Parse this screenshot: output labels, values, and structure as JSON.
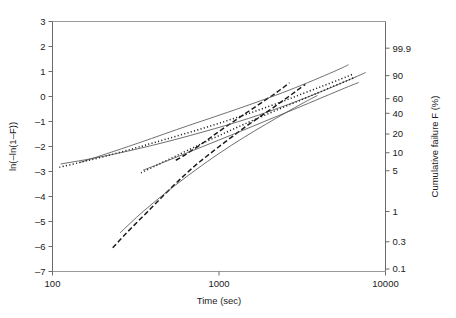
{
  "chart_data": {
    "type": "line",
    "title": "",
    "subtitle": "",
    "xlabel": "Time (sec)",
    "ylabel": "ln(–ln(1–F))",
    "y2label": "Cumulative failure F (%)",
    "xscale": "log",
    "xlim": [
      100,
      10000
    ],
    "ylim": [
      -7,
      3
    ],
    "grid": false,
    "legend": "none",
    "xticks": [
      "100",
      "1000",
      "10000"
    ],
    "xtick_values": [
      100,
      1000,
      10000
    ],
    "yticks": [
      "3",
      "2",
      "1",
      "0",
      "-1",
      "-2",
      "-3",
      "-4",
      "-5",
      "-6",
      "-7"
    ],
    "ytick_values": [
      3,
      2,
      1,
      0,
      -1,
      -2,
      -3,
      -4,
      -5,
      -6,
      -7
    ],
    "y2ticks": [
      "99.9",
      "90",
      "60",
      "40",
      "20",
      "10",
      "5",
      "1",
      "0.3",
      "0.1"
    ],
    "y2tick_values": [
      99.9,
      90,
      60,
      40,
      20,
      10,
      5,
      1,
      0.3,
      0.1
    ],
    "y2tick_positions": [
      1.933,
      0.834,
      -0.087,
      -0.672,
      -1.5,
      -2.25,
      -2.97,
      -4.6,
      -5.81,
      -6.9
    ],
    "series": [
      {
        "name": "dataset-1-data",
        "style": "dashed-thick",
        "color": "#1a1a1a",
        "points": [
          [
            550,
            -2.55
          ],
          [
            620,
            -2.35
          ],
          [
            700,
            -2.12
          ],
          [
            800,
            -1.86
          ],
          [
            900,
            -1.62
          ],
          [
            1000,
            -1.4
          ],
          [
            1150,
            -1.12
          ],
          [
            1300,
            -0.88
          ],
          [
            1500,
            -0.6
          ],
          [
            1700,
            -0.36
          ],
          [
            1900,
            -0.14
          ],
          [
            2100,
            0.05
          ],
          [
            2300,
            0.24
          ],
          [
            2500,
            0.42
          ],
          [
            2650,
            0.55
          ]
        ]
      },
      {
        "name": "dataset-1-fit",
        "style": "solid-thin",
        "color": "#4a4a4a",
        "points": [
          [
            145,
            -2.65
          ],
          [
            300,
            -1.95
          ],
          [
            600,
            -1.25
          ],
          [
            1000,
            -0.75
          ],
          [
            1600,
            -0.28
          ],
          [
            2400,
            0.15
          ],
          [
            3400,
            0.55
          ],
          [
            4600,
            0.92
          ],
          [
            5500,
            1.15
          ],
          [
            6000,
            1.27
          ]
        ]
      },
      {
        "name": "dataset-2-data",
        "style": "dotted",
        "color": "#1a1a1a",
        "points": [
          [
            110,
            -2.83
          ],
          [
            150,
            -2.62
          ],
          [
            210,
            -2.38
          ],
          [
            300,
            -2.1
          ],
          [
            420,
            -1.82
          ],
          [
            600,
            -1.52
          ],
          [
            850,
            -1.22
          ],
          [
            1200,
            -0.9
          ],
          [
            1700,
            -0.56
          ],
          [
            2400,
            -0.2
          ],
          [
            3200,
            0.12
          ],
          [
            4200,
            0.42
          ],
          [
            5400,
            0.7
          ],
          [
            6400,
            0.9
          ]
        ]
      },
      {
        "name": "dataset-2-fit",
        "style": "solid-thin",
        "color": "#4a4a4a",
        "points": [
          [
            112,
            -2.7
          ],
          [
            200,
            -2.4
          ],
          [
            400,
            -1.95
          ],
          [
            800,
            -1.42
          ],
          [
            1500,
            -0.88
          ],
          [
            2600,
            -0.32
          ],
          [
            4200,
            0.22
          ],
          [
            6200,
            0.7
          ],
          [
            7600,
            0.96
          ]
        ]
      },
      {
        "name": "dataset-3-data",
        "style": "dashed-thick",
        "color": "#1a1a1a",
        "points": [
          [
            230,
            -6.05
          ],
          [
            270,
            -5.55
          ],
          [
            320,
            -5.05
          ],
          [
            380,
            -4.55
          ],
          [
            450,
            -4.05
          ],
          [
            530,
            -3.58
          ],
          [
            620,
            -3.15
          ],
          [
            720,
            -2.76
          ],
          [
            840,
            -2.4
          ],
          [
            980,
            -2.05
          ],
          [
            1150,
            -1.7
          ],
          [
            1350,
            -1.35
          ],
          [
            1600,
            -1.0
          ],
          [
            1900,
            -0.66
          ],
          [
            2250,
            -0.32
          ],
          [
            2600,
            -0.02
          ],
          [
            2950,
            0.25
          ],
          [
            3300,
            0.48
          ]
        ]
      },
      {
        "name": "dataset-3-fit",
        "style": "solid-thin",
        "color": "#4a4a4a",
        "points": [
          [
            255,
            -5.45
          ],
          [
            350,
            -4.6
          ],
          [
            500,
            -3.75
          ],
          [
            720,
            -2.95
          ],
          [
            1000,
            -2.28
          ],
          [
            1400,
            -1.65
          ],
          [
            1900,
            -1.12
          ],
          [
            2500,
            -0.66
          ],
          [
            3200,
            -0.26
          ],
          [
            3900,
            0.04
          ]
        ]
      },
      {
        "name": "dataset-4-data",
        "style": "dotted",
        "color": "#1a1a1a",
        "points": [
          [
            340,
            -3.05
          ],
          [
            420,
            -2.76
          ],
          [
            520,
            -2.46
          ],
          [
            650,
            -2.15
          ],
          [
            820,
            -1.83
          ],
          [
            1050,
            -1.5
          ],
          [
            1350,
            -1.17
          ],
          [
            1750,
            -0.84
          ],
          [
            2300,
            -0.5
          ],
          [
            3000,
            -0.18
          ],
          [
            3900,
            0.14
          ],
          [
            4900,
            0.42
          ],
          [
            5900,
            0.64
          ],
          [
            6600,
            0.78
          ]
        ]
      },
      {
        "name": "dataset-4-fit",
        "style": "solid-thin",
        "color": "#4a4a4a",
        "points": [
          [
            350,
            -2.95
          ],
          [
            520,
            -2.5
          ],
          [
            800,
            -2.0
          ],
          [
            1250,
            -1.48
          ],
          [
            2000,
            -0.92
          ],
          [
            3100,
            -0.4
          ],
          [
            4600,
            0.08
          ],
          [
            6000,
            0.4
          ],
          [
            6900,
            0.56
          ]
        ]
      }
    ]
  }
}
